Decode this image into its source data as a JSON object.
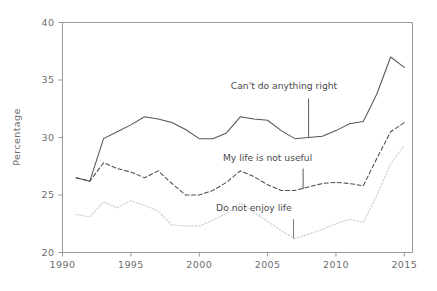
{
  "chart_data": {
    "type": "line",
    "title": "",
    "xlabel": "",
    "ylabel": "Percentage",
    "xlim": [
      1990,
      2015.6
    ],
    "ylim": [
      20,
      40
    ],
    "grid": false,
    "legend_position": "inline-annotations",
    "xticks": [
      1990,
      1995,
      2000,
      2005,
      2010,
      2015
    ],
    "xtick_labels": [
      "1990",
      "1995",
      "2000",
      "2005",
      "2010",
      "2015"
    ],
    "yticks": [
      20,
      25,
      30,
      35,
      40
    ],
    "ytick_labels": [
      "20",
      "25",
      "30",
      "35",
      "40"
    ],
    "x": [
      1991,
      1992,
      1993,
      1994,
      1995,
      1996,
      1997,
      1998,
      1999,
      2000,
      2001,
      2002,
      2003,
      2004,
      2005,
      2006,
      2007,
      2008,
      2009,
      2010,
      2011,
      2012,
      2013,
      2014,
      2015
    ],
    "series": [
      {
        "name": "Can't do anything right",
        "style": "solid",
        "color": "#555555",
        "values": [
          26.5,
          26.2,
          29.9,
          30.5,
          31.1,
          31.8,
          31.6,
          31.3,
          30.7,
          29.9,
          29.9,
          30.4,
          31.8,
          31.6,
          31.5,
          30.6,
          29.9,
          30.0,
          30.1,
          30.6,
          31.2,
          31.4,
          33.8,
          37.0,
          36.1
        ]
      },
      {
        "name": "My life is not useful",
        "style": "dashed",
        "color": "#4d4d4d",
        "values": [
          26.5,
          26.2,
          27.8,
          27.3,
          27.0,
          26.5,
          27.1,
          26.0,
          25.0,
          25.0,
          25.4,
          26.1,
          27.1,
          26.6,
          25.9,
          25.4,
          25.4,
          25.7,
          26.0,
          26.1,
          26.0,
          25.8,
          28.2,
          30.5,
          31.3
        ]
      },
      {
        "name": "Do not enjoy life",
        "style": "dotted",
        "color": "#d0d0d0",
        "values": [
          23.3,
          23.1,
          24.4,
          23.9,
          24.5,
          24.1,
          23.6,
          22.4,
          22.3,
          22.3,
          22.8,
          23.4,
          24.3,
          23.5,
          22.7,
          21.9,
          21.2,
          21.6,
          22.0,
          22.5,
          22.9,
          22.6,
          25.0,
          27.7,
          29.3
        ]
      }
    ],
    "annotations": [
      {
        "label": "Can't do anything right",
        "text_x": 2006.2,
        "text_y": 34.2,
        "point_x": 2008.0,
        "point_y": 30.0,
        "leader_top_y": 33.4,
        "color": "#4a4a4a"
      },
      {
        "label": "My life is not useful",
        "text_x": 2005.0,
        "text_y": 28.0,
        "point_x": 2007.6,
        "point_y": 25.5,
        "leader_top_y": 27.3,
        "color": "#4a4a4a"
      },
      {
        "label": "Do not enjoy life",
        "text_x": 2004.0,
        "text_y": 23.6,
        "point_x": 2006.9,
        "point_y": 21.2,
        "leader_top_y": 22.9,
        "color": "#6b6b6b"
      }
    ]
  }
}
